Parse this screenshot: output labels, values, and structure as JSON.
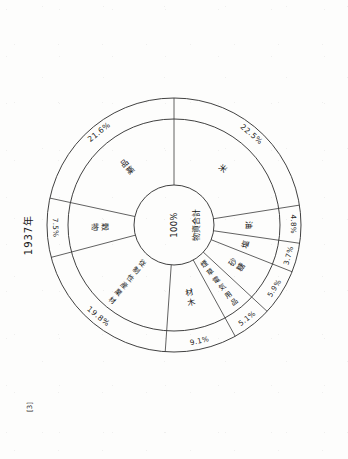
{
  "figure": {
    "year_caption": "1937年",
    "figure_mark": "[3]",
    "center_label_pct": "100%",
    "center_label_text": "物資合計",
    "units": "%"
  },
  "chart_data": {
    "type": "pie",
    "title": "1937年",
    "subtitle": "物資合計 100%",
    "center_total_label": "100%",
    "center_text": "物資合計",
    "xlabel": "",
    "ylabel": "",
    "grid": false,
    "legend_position": "on-slice",
    "value_unit": "percent",
    "total": 100.0,
    "categories": [
      "米",
      "油",
      "塩",
      "砂糖",
      "煙草電気用品",
      "材木",
      "従制性産業材料",
      "穀物",
      "薬品"
    ],
    "values": [
      22.5,
      4.8,
      3.7,
      5.9,
      5.1,
      9.1,
      19.8,
      7.5,
      21.6
    ],
    "labels": [
      "22.5%",
      "4.8%",
      "3.7%",
      "5.9%",
      "5.1%",
      "9.1%",
      "19.8%",
      "7.5%",
      "21.6%"
    ],
    "slices": [
      {
        "label": "米",
        "value": 22.5,
        "pct_text": "22.5%",
        "start_deg": -90.0,
        "end_deg": -9.0
      },
      {
        "label": "油",
        "value": 4.8,
        "pct_text": "4.8%",
        "start_deg": -9.0,
        "end_deg": 8.28
      },
      {
        "label": "塩",
        "value": 3.7,
        "pct_text": "3.7%",
        "start_deg": 8.28,
        "end_deg": 21.6
      },
      {
        "label": "砂糖",
        "value": 5.9,
        "pct_text": "5.9%",
        "start_deg": 21.6,
        "end_deg": 42.84
      },
      {
        "label": "煙草電気用品",
        "value": 5.1,
        "pct_text": "5.1%",
        "start_deg": 42.84,
        "end_deg": 61.2
      },
      {
        "label": "材木",
        "value": 9.1,
        "pct_text": "9.1%",
        "start_deg": 61.2,
        "end_deg": 93.96
      },
      {
        "label": "従制性産業材料",
        "value": 19.8,
        "pct_text": "19.8%",
        "start_deg": 93.96,
        "end_deg": 165.24
      },
      {
        "label": "穀物",
        "value": 7.5,
        "pct_text": "7.5%",
        "start_deg": 165.24,
        "end_deg": 192.24
      },
      {
        "label": "薬品",
        "value": 21.6,
        "pct_text": "21.6%",
        "start_deg": 192.24,
        "end_deg": 270.0
      }
    ]
  }
}
